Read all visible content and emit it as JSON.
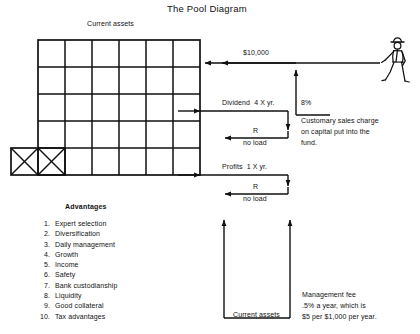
{
  "page": {
    "title": "The Pool Diagram",
    "background": "#ffffff",
    "ink": "#111111",
    "width": 420,
    "height": 334
  },
  "pool": {
    "label_top": "Current assets",
    "grid": {
      "columns": 6,
      "rows": 5,
      "crossed_cells": 2,
      "crossed_cells_note": "X"
    }
  },
  "investor": {
    "icon": "walking-man-icon",
    "inflow_amount": "$10,000",
    "sales_charge_percent": "8%",
    "sales_charge_note_line1": "Customary sales charge",
    "sales_charge_note_line2": "on capital put into the",
    "sales_charge_note_line3": "fund."
  },
  "distributions": [
    {
      "name": "dividend",
      "label": "Dividend  4 X yr.",
      "reinvest_label": "R",
      "load_label": "no load"
    },
    {
      "name": "profits",
      "label": "Profits  1 X yr.",
      "reinvest_label": "R",
      "load_label": "no load"
    }
  ],
  "advantages": {
    "heading": "Advantages",
    "items": [
      {
        "num": "1.",
        "text": "Expert selection"
      },
      {
        "num": "2.",
        "text": "Diversification"
      },
      {
        "num": "3.",
        "text": "Daily management"
      },
      {
        "num": "4.",
        "text": "Growth"
      },
      {
        "num": "5.",
        "text": "Income"
      },
      {
        "num": "6.",
        "text": "Safety"
      },
      {
        "num": "7.",
        "text": "Bank custodianship"
      },
      {
        "num": "8.",
        "text": "Liquidity"
      },
      {
        "num": "9.",
        "text": "Good collateral"
      },
      {
        "num": "10.",
        "text": "Tax advantages"
      }
    ]
  },
  "bracket": {
    "label": "Current assets",
    "fee_line1": "Management fee",
    "fee_line2": ".5% a year, which is",
    "fee_line3": "$5 per $1,000 per year."
  }
}
